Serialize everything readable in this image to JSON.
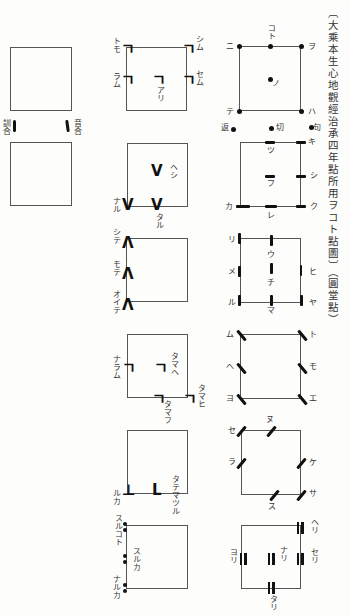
{
  "title": "〔大乘本生心地觀經治承四年點所用ヲコト點圖〕（圓堂點）",
  "legend": {
    "left": "訓合",
    "right": "音合"
  },
  "col1": {
    "d1": {
      "tl": "トモ",
      "tr": "シム",
      "ml": "ラム",
      "mr": "セム",
      "c": "アリ"
    },
    "d2": {
      "c": "ヘシ",
      "bl": "ナル",
      "bc": "タル"
    },
    "d3": {
      "l1": "シテ",
      "l2": "モテ",
      "l3": "オイテ"
    },
    "d4": {
      "ml": "ナラム",
      "c": "タマヘ",
      "bc": "タマフ",
      "br": "タマヒ"
    },
    "d5": {
      "bl": "ルカ",
      "bc": "タテマツル"
    },
    "d6": {
      "tl": "スルコト",
      "ml": "スルカ",
      "bl": "ナルカ"
    }
  },
  "col2": {
    "d1": {
      "tl": "ニ",
      "tc": "コト",
      "tr": "ヲ",
      "c": "ノ",
      "bl": "テ",
      "br": "ハ",
      "x1": "返",
      "x2": "切",
      "x3": "句"
    },
    "d2": {
      "tr": "キ",
      "tc": "ツ",
      "c": "フ",
      "mr": "シ",
      "bl": "カ",
      "bc": "レ",
      "br": "ク"
    },
    "d3": {
      "tl": "リ",
      "ml": "メ",
      "bl": "ル",
      "c1": "ウ",
      "c2": "チ",
      "bc": "マ",
      "mr": "ヒ",
      "br": "ヤ"
    },
    "d4": {
      "tl": "ム",
      "ml": "ヘ",
      "bl": "ヨ",
      "tr": "ト",
      "mr": "モ",
      "br": "エ"
    },
    "d5": {
      "tl": "セ",
      "tc": "ヌ",
      "ml": "ラ",
      "mr": "ケ",
      "bc": "ス",
      "br": "サ"
    },
    "d6": {
      "tr": "ヘリ",
      "mr": "セリ",
      "ml": "ヨリ",
      "c": "ナリ",
      "bc": "タリ"
    }
  }
}
